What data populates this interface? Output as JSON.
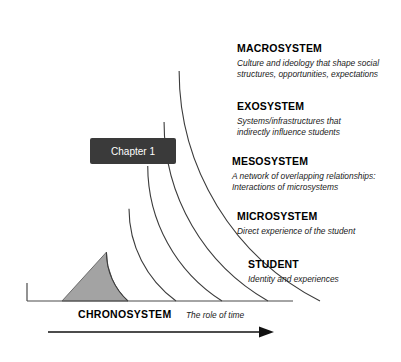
{
  "diagram": {
    "badge": {
      "label": "Chapter 1",
      "fill": "#3a3a3a",
      "text_color": "#ffffff"
    },
    "center_region": {
      "fill": "#a3a3a3",
      "stroke": "#6b6b6b"
    },
    "arc_stroke": "#3b3b3b",
    "rings": [
      {
        "id": "macrosystem",
        "title": "MACROSYSTEM",
        "desc_lines": [
          "Culture and ideology that shape social",
          "structures, opportunities, expectations"
        ],
        "radius": 258,
        "label_x": 237,
        "title_y": 52,
        "desc_y": 66
      },
      {
        "id": "exosystem",
        "title": "EXOSYSTEM",
        "desc_lines": [
          "Systems/infrastructures that",
          "indirectly influence students"
        ],
        "radius": 206,
        "label_x": 237,
        "title_y": 110,
        "desc_y": 124
      },
      {
        "id": "mesosystem",
        "title": "MESOSYSTEM",
        "desc_lines": [
          "A network of overlapping relationships:",
          "Interactions of microsystems"
        ],
        "radius": 160,
        "label_x": 232,
        "title_y": 165,
        "desc_y": 179
      },
      {
        "id": "microsystem",
        "title": "MICROSYSTEM",
        "desc_lines": [
          "Direct experience of the student"
        ],
        "radius": 114,
        "label_x": 237,
        "title_y": 220,
        "desc_y": 234
      },
      {
        "id": "student",
        "title": "STUDENT",
        "desc_lines": [
          "Identity and experiences"
        ],
        "radius": 66,
        "label_x": 248,
        "title_y": 268,
        "desc_y": 282
      }
    ],
    "chronosystem": {
      "title": "CHRONOSYSTEM",
      "desc": "The role of time",
      "title_x": 78,
      "desc_x": 186,
      "text_y": 318,
      "arrow_y": 332,
      "arrow_x1": 48,
      "arrow_x2": 268
    }
  }
}
